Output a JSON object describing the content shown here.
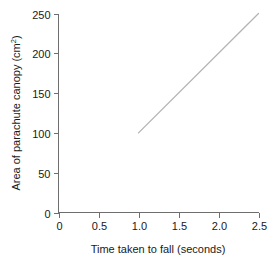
{
  "chart_data": {
    "type": "line",
    "title": "",
    "subtitle": "",
    "xlabel": "Time taken to fall (seconds)",
    "ylabel_main": "Area of parachute canopy (cm",
    "ylabel_sup": "2",
    "ylabel_close": ")",
    "ylabel": "Area of parachute canopy (cm2)",
    "xlim": [
      0,
      2.5
    ],
    "ylim": [
      0,
      250
    ],
    "xticks": [
      0,
      0.5,
      1.0,
      1.5,
      2.0,
      2.5
    ],
    "xticklabels": [
      "0",
      "0.5",
      "1.0",
      "1.5",
      "2.0",
      "2.5"
    ],
    "yticks": [
      0,
      50,
      100,
      150,
      200,
      250
    ],
    "yticklabels": [
      "0",
      "50",
      "100",
      "150",
      "200",
      "250"
    ],
    "grid": false,
    "legend": "none",
    "annotations": [],
    "series": [
      {
        "name": "Area of parachute canopy",
        "color": "#b4b4b4",
        "x": [
          1.0,
          2.5
        ],
        "values": [
          100,
          250
        ]
      }
    ]
  },
  "colors": {
    "line": "#b4b4b4",
    "axis": "#6e6e6e",
    "text": "#1a1a1a",
    "background": "#ffffff"
  }
}
